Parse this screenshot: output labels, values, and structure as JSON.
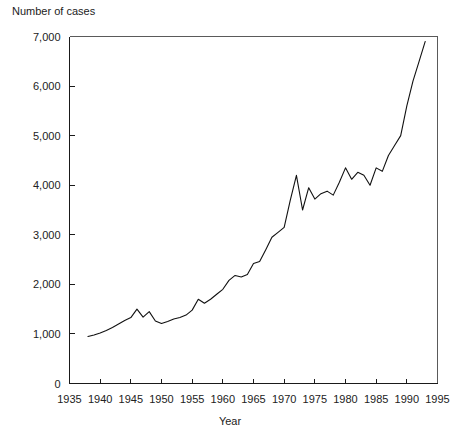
{
  "chart_data": {
    "type": "line",
    "title": "",
    "ylabel": "Number of cases",
    "xlabel": "Year",
    "xlim": [
      1935,
      1995
    ],
    "ylim": [
      0,
      7000
    ],
    "xticks": [
      1935,
      1940,
      1945,
      1950,
      1955,
      1960,
      1965,
      1970,
      1975,
      1980,
      1985,
      1990,
      1995
    ],
    "xtick_labels": [
      "1935",
      "1940",
      "1945",
      "1950",
      "1955",
      "1960",
      "1965",
      "1970",
      "1975",
      "1980",
      "1985",
      "1990",
      "1995"
    ],
    "yticks": [
      0,
      1000,
      2000,
      3000,
      4000,
      5000,
      6000,
      7000
    ],
    "ytick_labels": [
      "0",
      "1,000",
      "2,000",
      "3,000",
      "4,000",
      "5,000",
      "6,000",
      "7,000"
    ],
    "grid": false,
    "legend": false,
    "legend_position": "none",
    "line_color": "#111111",
    "series": [
      {
        "name": "Number of cases",
        "x": [
          1938,
          1939,
          1940,
          1941,
          1942,
          1943,
          1944,
          1945,
          1946,
          1947,
          1948,
          1949,
          1950,
          1951,
          1952,
          1953,
          1954,
          1955,
          1956,
          1957,
          1958,
          1959,
          1960,
          1961,
          1962,
          1963,
          1964,
          1965,
          1966,
          1967,
          1968,
          1969,
          1970,
          1971,
          1972,
          1973,
          1974,
          1975,
          1976,
          1977,
          1978,
          1979,
          1980,
          1981,
          1982,
          1983,
          1984,
          1985,
          1986,
          1987,
          1988,
          1989,
          1990,
          1991,
          1992,
          1993
        ],
        "values": [
          950,
          980,
          1020,
          1070,
          1130,
          1200,
          1270,
          1330,
          1500,
          1340,
          1450,
          1260,
          1210,
          1250,
          1300,
          1330,
          1380,
          1480,
          1700,
          1620,
          1700,
          1800,
          1900,
          2080,
          2180,
          2150,
          2200,
          2420,
          2460,
          2700,
          2950,
          3050,
          3150,
          3700,
          4200,
          3500,
          3950,
          3720,
          3830,
          3880,
          3800,
          4060,
          4350,
          4120,
          4260,
          4200,
          4000,
          4350,
          4280,
          4600,
          4800,
          5000,
          5600,
          6100,
          6500,
          6900
        ]
      }
    ]
  }
}
